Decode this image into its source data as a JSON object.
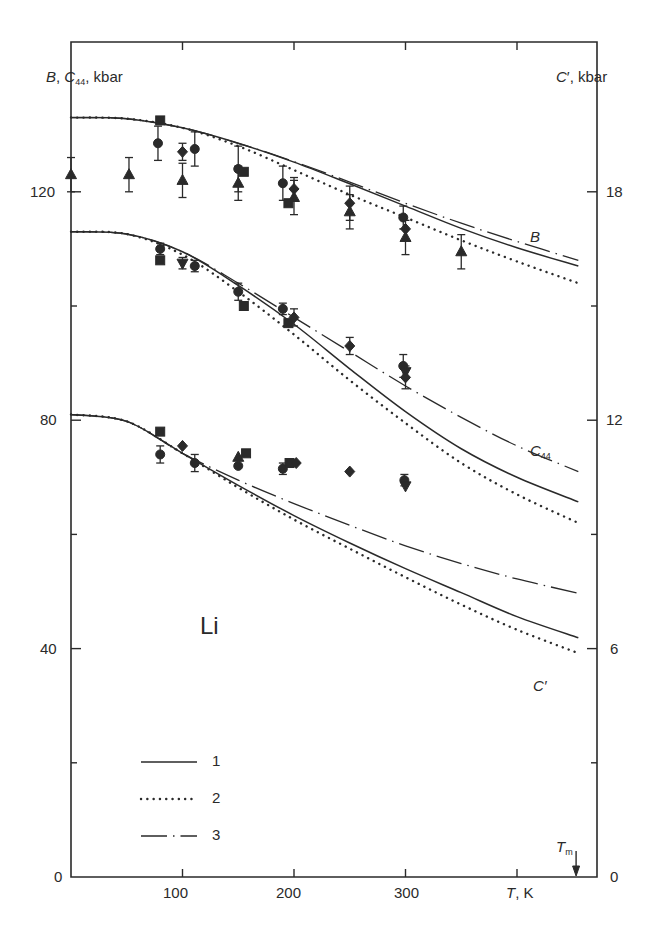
{
  "chart_data": {
    "type": "line",
    "title": "",
    "material_label": "Li",
    "xlabel": "T, K",
    "ylabel_left": "B, C44, kbar",
    "ylabel_right": "C', kbar",
    "xlim": [
      0,
      470
    ],
    "ylim_left": [
      0,
      140
    ],
    "ylim_right": [
      0,
      21
    ],
    "x_ticks": [
      100,
      200,
      300,
      400
    ],
    "x_tick_labels": [
      "100",
      "200",
      "300",
      ""
    ],
    "y_left_ticks": [
      0,
      20,
      40,
      60,
      80,
      100,
      120
    ],
    "y_left_tick_labels": [
      "0",
      "",
      "40",
      "",
      "80",
      "",
      "120"
    ],
    "y_right_ticks": [
      0,
      3,
      6,
      9,
      12,
      15,
      18
    ],
    "y_right_tick_labels": [
      "0",
      "",
      "6",
      "",
      "12",
      "",
      "18"
    ],
    "grid": false,
    "melting_point": {
      "label": "Tm",
      "T": 453
    },
    "legend": {
      "position": "lower-left",
      "entries": [
        {
          "id": "1",
          "label": "1",
          "style": "solid"
        },
        {
          "id": "2",
          "label": "2",
          "style": "dotted"
        },
        {
          "id": "3",
          "label": "3",
          "style": "dash-dot"
        }
      ]
    },
    "curve_labels": [
      {
        "text": "B",
        "T": 435,
        "value": 120
      },
      {
        "text": "C44",
        "T": 435,
        "value": 78
      },
      {
        "text": "C'",
        "T": 435,
        "value": 36
      }
    ],
    "x": [
      0,
      50,
      100,
      150,
      200,
      250,
      300,
      350,
      400,
      455
    ],
    "series": [
      {
        "name": "B (1)",
        "group": "B",
        "style": "solid",
        "axis": "left",
        "values": [
          133,
          132.8,
          131.2,
          128.5,
          125.2,
          121.4,
          117.5,
          113.6,
          110.2,
          107
        ]
      },
      {
        "name": "B (2)",
        "group": "B",
        "style": "dotted",
        "axis": "left",
        "values": [
          133,
          132.8,
          131.2,
          128.0,
          123.8,
          119.5,
          115.5,
          111.5,
          107.8,
          104
        ]
      },
      {
        "name": "B (3)",
        "group": "B",
        "style": "dash-dot",
        "axis": "left",
        "values": [
          133,
          132.8,
          131.2,
          128.5,
          125.3,
          121.7,
          118.0,
          114.5,
          111.3,
          108
        ]
      },
      {
        "name": "C44 (1)",
        "group": "C44",
        "style": "solid",
        "axis": "left",
        "values": [
          113,
          112.6,
          109.5,
          103.6,
          96.8,
          89.0,
          81.5,
          75.0,
          70.0,
          65.7
        ]
      },
      {
        "name": "C44 (2)",
        "group": "C44",
        "style": "dotted",
        "axis": "left",
        "values": [
          113,
          112.6,
          109.0,
          102.5,
          95.0,
          87.0,
          79.5,
          72.5,
          67.0,
          62.0
        ]
      },
      {
        "name": "C44 (3)",
        "group": "C44",
        "style": "dash-dot",
        "axis": "left",
        "values": [
          113,
          112.6,
          109.5,
          104.0,
          98.0,
          92.0,
          86.0,
          80.5,
          75.5,
          71.0
        ]
      },
      {
        "name": "C' (1)",
        "group": "C'",
        "style": "solid",
        "axis": "left",
        "right_axis_scale": 0.15,
        "values": [
          81,
          79.8,
          74.2,
          68.6,
          63.3,
          58.5,
          54.0,
          49.8,
          45.6,
          41.9
        ]
      },
      {
        "name": "C' (2)",
        "group": "C'",
        "style": "dotted",
        "axis": "left",
        "right_axis_scale": 0.15,
        "values": [
          81,
          79.8,
          74.2,
          68.2,
          62.6,
          57.5,
          52.5,
          47.7,
          43.3,
          39.2
        ]
      },
      {
        "name": "C' (3)",
        "group": "C'",
        "style": "dash-dot",
        "axis": "left",
        "right_axis_scale": 0.15,
        "values": [
          81,
          79.8,
          74.2,
          69.5,
          65.4,
          61.6,
          58.0,
          54.9,
          52.2,
          49.7
        ]
      }
    ],
    "experimental_points": [
      {
        "group": "B",
        "marker": "square",
        "T": 80,
        "value": 132.5
      },
      {
        "group": "B",
        "marker": "circle",
        "T": 78,
        "value": 128.5,
        "err": 3
      },
      {
        "group": "B",
        "marker": "triangle",
        "T": 0,
        "value": 123,
        "err": 3
      },
      {
        "group": "B",
        "marker": "triangle",
        "T": 52,
        "value": 123,
        "err": 3
      },
      {
        "group": "B",
        "marker": "diamond",
        "T": 100,
        "value": 127,
        "err": 1.5
      },
      {
        "group": "B",
        "marker": "circle",
        "T": 111,
        "value": 127.5,
        "err": 3
      },
      {
        "group": "B",
        "marker": "triangle",
        "T": 100,
        "value": 122,
        "err": 3
      },
      {
        "group": "B",
        "marker": "circle",
        "T": 150,
        "value": 124,
        "err": 4
      },
      {
        "group": "B",
        "marker": "square",
        "T": 155,
        "value": 123.5
      },
      {
        "group": "B",
        "marker": "triangle",
        "T": 150,
        "value": 121.5,
        "err": 3
      },
      {
        "group": "B",
        "marker": "circle",
        "T": 190,
        "value": 121.5,
        "err": 3
      },
      {
        "group": "B",
        "marker": "diamond",
        "T": 200,
        "value": 120.5,
        "err": 2
      },
      {
        "group": "B",
        "marker": "triangle",
        "T": 200,
        "value": 119,
        "err": 3
      },
      {
        "group": "B",
        "marker": "square",
        "T": 195,
        "value": 118
      },
      {
        "group": "B",
        "marker": "diamond",
        "T": 250,
        "value": 118,
        "err": 3
      },
      {
        "group": "B",
        "marker": "triangle",
        "T": 250,
        "value": 116.5,
        "err": 3
      },
      {
        "group": "B",
        "marker": "circle",
        "T": 298,
        "value": 115.5,
        "err": 2
      },
      {
        "group": "B",
        "marker": "diamond",
        "T": 300,
        "value": 113.5
      },
      {
        "group": "B",
        "marker": "triangle",
        "T": 300,
        "value": 112,
        "err": 3
      },
      {
        "group": "B",
        "marker": "triangle",
        "T": 350,
        "value": 109.5,
        "err": 3
      },
      {
        "group": "C44",
        "marker": "circle",
        "T": 80,
        "value": 110,
        "err": 1
      },
      {
        "group": "C44",
        "marker": "square",
        "T": 80,
        "value": 108
      },
      {
        "group": "C44",
        "marker": "triangle-down",
        "T": 100,
        "value": 107.5,
        "err": 1
      },
      {
        "group": "C44",
        "marker": "circle",
        "T": 111,
        "value": 107,
        "err": 1
      },
      {
        "group": "C44",
        "marker": "circle",
        "T": 150,
        "value": 102.5,
        "err": 1.5
      },
      {
        "group": "C44",
        "marker": "square",
        "T": 155,
        "value": 100
      },
      {
        "group": "C44",
        "marker": "circle",
        "T": 190,
        "value": 99.5,
        "err": 1
      },
      {
        "group": "C44",
        "marker": "square",
        "T": 195,
        "value": 97
      },
      {
        "group": "C44",
        "marker": "diamond",
        "T": 200,
        "value": 98,
        "err": 1.5
      },
      {
        "group": "C44",
        "marker": "diamond",
        "T": 250,
        "value": 93,
        "err": 1.5
      },
      {
        "group": "C44",
        "marker": "circle",
        "T": 298,
        "value": 89.5,
        "err": 2
      },
      {
        "group": "C44",
        "marker": "triangle-down",
        "T": 300,
        "value": 88.5
      },
      {
        "group": "C44",
        "marker": "diamond",
        "T": 300,
        "value": 87.5,
        "err": 2
      },
      {
        "group": "C'",
        "marker": "square",
        "T": 80,
        "value": 78
      },
      {
        "group": "C'",
        "marker": "circle",
        "T": 80,
        "value": 74,
        "err": 1.5
      },
      {
        "group": "C'",
        "marker": "diamond",
        "T": 100,
        "value": 75.5
      },
      {
        "group": "C'",
        "marker": "circle",
        "T": 111,
        "value": 72.5,
        "err": 1.5
      },
      {
        "group": "C'",
        "marker": "triangle",
        "T": 150,
        "value": 73.5
      },
      {
        "group": "C'",
        "marker": "square",
        "T": 157,
        "value": 74.2
      },
      {
        "group": "C'",
        "marker": "circle",
        "T": 150,
        "value": 72
      },
      {
        "group": "C'",
        "marker": "circle",
        "T": 190,
        "value": 71.5,
        "err": 1
      },
      {
        "group": "C'",
        "marker": "square",
        "T": 196,
        "value": 72.5
      },
      {
        "group": "C'",
        "marker": "diamond",
        "T": 202,
        "value": 72.5
      },
      {
        "group": "C'",
        "marker": "diamond",
        "T": 250,
        "value": 71
      },
      {
        "group": "C'",
        "marker": "circle",
        "T": 299,
        "value": 69.5,
        "err": 1
      },
      {
        "group": "C'",
        "marker": "triangle-down",
        "T": 300,
        "value": 68.5
      }
    ]
  },
  "labels": {
    "left_axis": {
      "B": "B",
      "C": "C",
      "sub": "44",
      "unit": ", kbar"
    },
    "right_axis": {
      "C": "C",
      "prime": "′",
      "unit": ", kbar"
    },
    "x_axis": {
      "T": "T",
      "unit": ",  K"
    },
    "curve_B": "B",
    "curve_C44": {
      "C": "C",
      "sub": "44"
    },
    "curve_Cprime": "C′",
    "material": "Li",
    "tm": {
      "T": "T",
      "sub": "m"
    },
    "legend": [
      "1",
      "2",
      "3"
    ],
    "x_ticks": [
      "100",
      "200",
      "300"
    ],
    "left_ticks": [
      "0",
      "40",
      "80",
      "120"
    ],
    "right_ticks": [
      "0",
      "6",
      "12",
      "18"
    ]
  },
  "colors": {
    "ink": "#2a2a2a",
    "background": "#ffffff"
  }
}
